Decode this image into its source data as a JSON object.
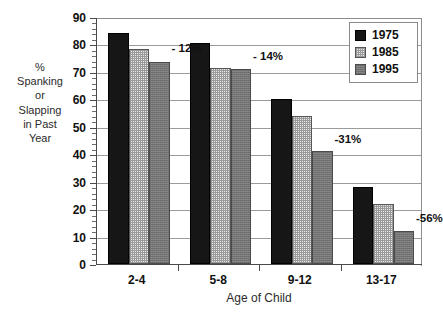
{
  "chart_data": {
    "type": "bar",
    "title": "",
    "subtitle": "",
    "xlabel": "Age of Child",
    "ylabel": "% Spanking or Slapping in Past Year",
    "ylabel_lines": [
      "%",
      "Spanking",
      "or",
      "Slapping",
      "in Past",
      "Year"
    ],
    "categories": [
      "2-4",
      "5-8",
      "9-12",
      "13-17"
    ],
    "series": [
      {
        "name": "1975",
        "values": [
          84,
          80.5,
          60,
          28
        ],
        "color": "#161616"
      },
      {
        "name": "1985",
        "values": [
          78.5,
          71.5,
          54,
          22
        ],
        "color": "#e9e9e9"
      },
      {
        "name": "1995",
        "values": [
          73.5,
          71,
          41,
          12
        ],
        "color": "#8c8c8c"
      }
    ],
    "ylim": [
      0,
      90
    ],
    "ytick_step": 10,
    "yticks": [
      0,
      10,
      20,
      30,
      40,
      50,
      60,
      70,
      80,
      90
    ],
    "ytick_labels": [
      "0",
      "10",
      "20",
      "30",
      "40",
      "50",
      "60",
      "70",
      "80",
      "90"
    ],
    "minor_ticks": true,
    "grid": true,
    "grid_axis": "y",
    "legend_position": "top-right",
    "legend_entries": [
      "1975",
      "1985",
      "1995"
    ],
    "annotations": [
      {
        "text": "- 12%",
        "category": "2-4",
        "value": 79
      },
      {
        "text": "- 14%",
        "category": "5-8",
        "value": 76
      },
      {
        "text": "-31%",
        "category": "9-12",
        "value": 46
      },
      {
        "text": "-56%",
        "category": "13-17",
        "value": 17
      }
    ]
  }
}
